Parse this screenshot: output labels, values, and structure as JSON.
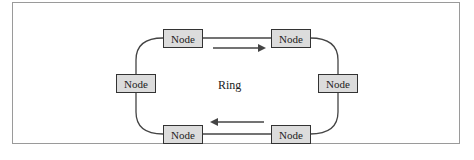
{
  "diagram": {
    "center_label": "Ring",
    "nodes": [
      {
        "id": "top-left",
        "label": "Node"
      },
      {
        "id": "top-right",
        "label": "Node"
      },
      {
        "id": "left",
        "label": "Node"
      },
      {
        "id": "right",
        "label": "Node"
      },
      {
        "id": "bottom-left",
        "label": "Node"
      },
      {
        "id": "bottom-right",
        "label": "Node"
      }
    ],
    "arrows": [
      {
        "from": "top-left",
        "to": "top-right",
        "direction": "right"
      },
      {
        "from": "bottom-right",
        "to": "bottom-left",
        "direction": "left"
      }
    ],
    "colors": {
      "node_fill": "#dcdcdc",
      "node_border": "#333333",
      "line": "#333333",
      "frame": "#9a9a9a"
    }
  }
}
